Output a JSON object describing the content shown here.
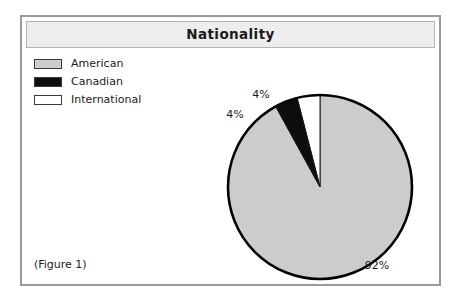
{
  "figure": {
    "title": "Nationality",
    "caption": "(Figure 1)",
    "frame_color": "#9a9a9a",
    "title_band_color": "#ededed",
    "background": "#ffffff"
  },
  "chart_data": {
    "type": "pie",
    "title": "Nationality",
    "categories": [
      "American",
      "Canadian",
      "International"
    ],
    "values": [
      92,
      4,
      4
    ],
    "value_labels": [
      "92%",
      "4%",
      "4%"
    ],
    "colors": [
      "#cccccc",
      "#0d0d0d",
      "#ffffff"
    ],
    "slice_border_color": "#1a1a1a",
    "outline_color": "#000000",
    "legend_position": "top-left",
    "grid": false,
    "units": "percent",
    "start_angle_deg": 0,
    "direction": "counter-clockwise",
    "slices": [
      {
        "label": "American",
        "value": 92,
        "value_label": "92%",
        "color": "#cccccc",
        "label_x": 355,
        "label_y": 252
      },
      {
        "label": "Canadian",
        "value": 4,
        "value_label": "4%",
        "color": "#0d0d0d",
        "label_x": 213,
        "label_y": 101
      },
      {
        "label": "International",
        "value": 4,
        "value_label": "4%",
        "color": "#ffffff",
        "label_x": 239,
        "label_y": 81
      }
    ],
    "geometry": {
      "center_x": 298,
      "center_y": 170,
      "radius": 92
    }
  },
  "legend": {
    "items": [
      {
        "label": "American",
        "swatch_color": "#cccccc",
        "swatch_name": "legend-swatch-american"
      },
      {
        "label": "Canadian",
        "swatch_color": "#0d0d0d",
        "swatch_name": "legend-swatch-canadian"
      },
      {
        "label": "International",
        "swatch_color": "#ffffff",
        "swatch_name": "legend-swatch-international"
      }
    ]
  }
}
